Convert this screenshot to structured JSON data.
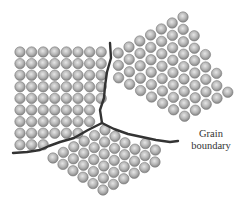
{
  "diagram": {
    "label": {
      "line1": "Grain",
      "line2": "boundary",
      "x": 180,
      "y": 128
    },
    "colors": {
      "atom_fill_center": "#d9d9d9",
      "atom_fill_edge": "#8a8a8a",
      "atom_stroke": "#7a7a7a",
      "boundary": "#333333",
      "text": "#333333"
    },
    "atom_radius": 5.2,
    "boundaries": [
      {
        "name": "vertical-boundary",
        "points": [
          [
            110,
            43
          ],
          [
            111,
            58
          ],
          [
            107,
            72
          ],
          [
            105,
            86
          ],
          [
            104,
            98
          ],
          [
            100,
            110
          ],
          [
            102,
            123
          ]
        ]
      },
      {
        "name": "left-boundary",
        "points": [
          [
            102,
            123
          ],
          [
            88,
            130
          ],
          [
            74,
            138
          ],
          [
            60,
            142
          ],
          [
            49,
            146
          ],
          [
            40,
            150
          ],
          [
            27,
            152
          ],
          [
            13,
            153
          ]
        ]
      },
      {
        "name": "right-boundary",
        "points": [
          [
            102,
            123
          ],
          [
            114,
            129
          ],
          [
            128,
            134
          ],
          [
            142,
            137
          ],
          [
            156,
            140
          ],
          [
            170,
            142
          ],
          [
            178,
            141
          ]
        ]
      }
    ],
    "grains": [
      {
        "name": "grain-left",
        "origin": [
          20,
          52
        ],
        "a": [
          11.6,
          0
        ],
        "b": [
          0,
          11.6
        ],
        "range_i": [
          0,
          8
        ],
        "range_j": [
          0,
          9
        ],
        "polygon": [
          [
            14,
            46
          ],
          [
            108,
            46
          ],
          [
            110,
            58
          ],
          [
            106,
            72
          ],
          [
            104,
            86
          ],
          [
            103,
            98
          ],
          [
            99,
            110
          ],
          [
            101,
            122
          ],
          [
            88,
            129
          ],
          [
            74,
            137
          ],
          [
            60,
            141
          ],
          [
            48,
            145
          ],
          [
            38,
            149
          ],
          [
            14,
            151
          ]
        ]
      },
      {
        "name": "grain-right",
        "origin": [
          183,
          17
        ],
        "a": [
          11.0,
          6.4
        ],
        "b": [
          -10.8,
          6.0
        ],
        "range_i": [
          -1,
          9
        ],
        "range_j": [
          0,
          9
        ],
        "polygon": [
          [
            112,
            44
          ],
          [
            180,
            10
          ],
          [
            232,
            88
          ],
          [
            222,
            112
          ],
          [
            200,
            130
          ],
          [
            178,
            139
          ],
          [
            156,
            138
          ],
          [
            142,
            135
          ],
          [
            128,
            132
          ],
          [
            114,
            127
          ],
          [
            104,
            121
          ],
          [
            101,
            110
          ],
          [
            105,
            98
          ],
          [
            106,
            86
          ],
          [
            108,
            72
          ],
          [
            112,
            58
          ]
        ]
      },
      {
        "name": "grain-bottom",
        "origin": [
          103,
          190
        ],
        "a": [
          10.4,
          -5.6
        ],
        "b": [
          -10.0,
          -6.4
        ],
        "range_i": [
          0,
          8
        ],
        "range_j": [
          0,
          9
        ],
        "polygon": [
          [
            103,
            126
          ],
          [
            114,
            132
          ],
          [
            128,
            137
          ],
          [
            142,
            140
          ],
          [
            156,
            143
          ],
          [
            168,
            145
          ],
          [
            152,
            170
          ],
          [
            112,
            198
          ],
          [
            95,
            196
          ],
          [
            60,
            180
          ],
          [
            26,
            160
          ],
          [
            28,
            155
          ],
          [
            40,
            153
          ],
          [
            50,
            149
          ],
          [
            61,
            145
          ],
          [
            75,
            141
          ],
          [
            89,
            133
          ]
        ]
      }
    ]
  }
}
